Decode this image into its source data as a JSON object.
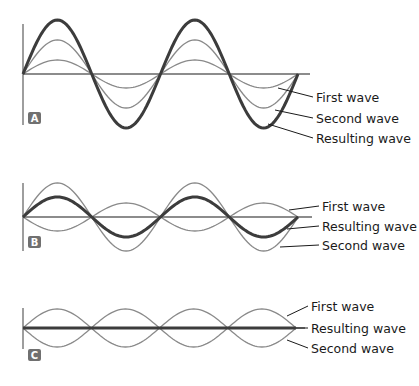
{
  "colors": {
    "thin_wave": "#8a8a8a",
    "resulting_wave": "#3c3c3c",
    "badge": "#707070",
    "text": "#1a1a1a"
  },
  "panels": [
    {
      "id": "A",
      "badge": "A",
      "description": "Constructive interference",
      "x_start": 23,
      "x_end": 298,
      "baseline_y": 74,
      "baseline_end": 310,
      "axis": {
        "top": 24,
        "bottom": 125
      },
      "badge_pos": {
        "x": 28,
        "y": 112
      },
      "half_periods": 4,
      "waves": [
        {
          "name": "first",
          "amplitude": 14,
          "sign": 1,
          "style": "thin"
        },
        {
          "name": "second",
          "amplitude": 34,
          "sign": 1,
          "style": "thin"
        },
        {
          "name": "resulting",
          "amplitude": 54,
          "sign": 1,
          "style": "thick"
        }
      ],
      "labels": [
        {
          "text": "First wave",
          "y": 97,
          "from": [
            278,
            88
          ]
        },
        {
          "text": "Second wave",
          "y": 118,
          "from": [
            275,
            110
          ]
        },
        {
          "text": "Resulting wave",
          "y": 138,
          "from": [
            268,
            124
          ]
        }
      ],
      "label_x": 316
    },
    {
      "id": "B",
      "badge": "B",
      "description": "Partial destructive interference",
      "x_start": 23,
      "x_end": 298,
      "baseline_y": 217,
      "baseline_end": 312,
      "axis": {
        "top": 183,
        "bottom": 251
      },
      "badge_pos": {
        "x": 28,
        "y": 236
      },
      "half_periods": 4,
      "waves": [
        {
          "name": "first",
          "amplitude": 14,
          "sign": -1,
          "style": "thin"
        },
        {
          "name": "second",
          "amplitude": 34,
          "sign": 1,
          "style": "thin"
        },
        {
          "name": "resulting",
          "amplitude": 20,
          "sign": 1,
          "style": "thick"
        }
      ],
      "labels": [
        {
          "text": "First wave",
          "y": 206,
          "from": [
            289,
            210
          ]
        },
        {
          "text": "Resulting wave",
          "y": 226,
          "from": [
            287,
            229
          ]
        },
        {
          "text": "Second wave",
          "y": 245,
          "from": [
            280,
            247
          ]
        }
      ],
      "label_x": 322
    },
    {
      "id": "C",
      "badge": "C",
      "description": "Complete destructive interference",
      "x_start": 23,
      "x_end": 296,
      "baseline_y": 328,
      "baseline_end": 305,
      "axis": {
        "top": 308,
        "bottom": 349
      },
      "badge_pos": {
        "x": 28,
        "y": 349
      },
      "half_periods": 4,
      "waves": [
        {
          "name": "first",
          "amplitude": 19,
          "sign": 1,
          "style": "thin"
        },
        {
          "name": "second",
          "amplitude": 19,
          "sign": -1,
          "style": "thin"
        },
        {
          "name": "resulting",
          "amplitude": 0,
          "sign": 1,
          "style": "thick"
        }
      ],
      "labels": [
        {
          "text": "First wave",
          "y": 306,
          "from": [
            287,
            316
          ]
        },
        {
          "text": "Resulting wave",
          "y": 328,
          "from": [
            296,
            328
          ]
        },
        {
          "text": "Second wave",
          "y": 348,
          "from": [
            287,
            340
          ]
        }
      ],
      "label_x": 311
    }
  ]
}
